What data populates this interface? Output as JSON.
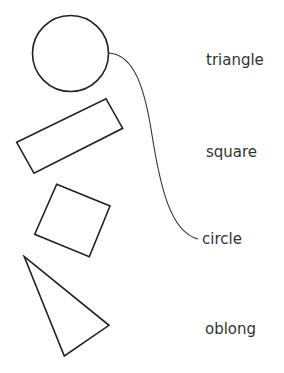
{
  "diagram": {
    "type": "matching-exercise",
    "shapes": [
      {
        "id": "shape-circle",
        "kind": "circle"
      },
      {
        "id": "shape-rectangle",
        "kind": "oblong"
      },
      {
        "id": "shape-square",
        "kind": "square"
      },
      {
        "id": "shape-triangle",
        "kind": "triangle"
      }
    ],
    "labels": [
      "triangle",
      "square",
      "circle",
      "oblong"
    ],
    "connections": [
      {
        "from": "shape-circle",
        "to_label": "circle"
      }
    ],
    "colors": {
      "stroke": "#222222",
      "text": "#333333",
      "background": "#ffffff"
    }
  }
}
